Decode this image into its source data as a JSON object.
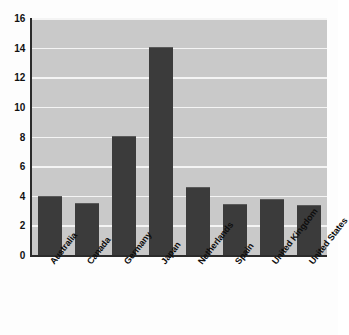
{
  "chart_data": {
    "type": "bar",
    "title": "",
    "subtitle": "",
    "xlabel": "",
    "ylabel": "",
    "categories": [
      "Australia",
      "Canada",
      "Germany",
      "Japan",
      "Netherlands",
      "Spain",
      "United Kingdom",
      "United States"
    ],
    "values": [
      4.0,
      3.5,
      8.05,
      14.05,
      4.6,
      3.45,
      3.8,
      3.35
    ],
    "ylim": [
      0,
      16
    ],
    "ytick_labels": [
      "0",
      "2",
      "4",
      "6",
      "8",
      "10",
      "12",
      "14",
      "16"
    ],
    "ytick_values": [
      0,
      2,
      4,
      6,
      8,
      10,
      12,
      14,
      16
    ],
    "grid": "horizontal",
    "legend": "none",
    "colors": {
      "bar": "#3b3b3b",
      "plot_background": "#c9c9c9",
      "gridline": "#f4f4f4",
      "axis": "#2b2b2b",
      "figure_background": "#fdfdfd",
      "tick_text": "#111111"
    }
  }
}
